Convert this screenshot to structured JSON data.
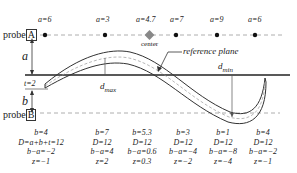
{
  "probes": {
    "top": {
      "word": "probe",
      "letter": "A"
    },
    "bottom": {
      "word": "probe",
      "letter": "B"
    }
  },
  "top_labels": [
    "a=6",
    "a=3",
    "a=4.7",
    "a=7",
    "a=9",
    "a=6"
  ],
  "labels": {
    "center": "center",
    "reference_plane": "reference plane",
    "d_max_d": "d",
    "d_max_sub": "max",
    "d_min_d": "d",
    "d_min_sub": "min",
    "a": "a",
    "b": "b",
    "t": "t=2"
  },
  "columns": [
    {
      "b": "b=4",
      "D": "D=a+b+t=12",
      "ba": "b−a=−2",
      "z": "z=−1"
    },
    {
      "b": "b=7",
      "D": "D=12",
      "ba": "b−a=4",
      "z": "z=2"
    },
    {
      "b": "b=5.3",
      "D": "D=12",
      "ba": "b−a=0.6",
      "z": "z=0.3"
    },
    {
      "b": "b=3",
      "D": "D=12",
      "ba": "b−a=−4",
      "z": "z=−2"
    },
    {
      "b": "b=1",
      "D": "D=12",
      "ba": "b−a=−8",
      "z": "z=−4"
    },
    {
      "b": "b=4",
      "D": "D=12",
      "ba": "b−a=−2",
      "z": "z=−1"
    }
  ],
  "colors": {
    "line": "#333333",
    "center_marker": "#888888",
    "dashed": "#999999"
  }
}
